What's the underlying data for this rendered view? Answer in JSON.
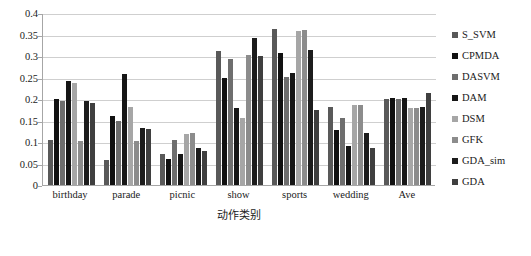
{
  "chart_data": {
    "type": "bar",
    "title": "",
    "xlabel": "动作类别",
    "ylabel": "",
    "ylim": [
      0,
      0.4
    ],
    "ytick_labels": [
      "0",
      "0.05",
      "0.1",
      "0.15",
      "0.2",
      "0.25",
      "0.3",
      "0.35",
      "0.4"
    ],
    "ytick_values": [
      0,
      0.05,
      0.1,
      0.15,
      0.2,
      0.25,
      0.3,
      0.35,
      0.4
    ],
    "grid": true,
    "legend_position": "right",
    "categories": [
      "birthday",
      "parade",
      "picnic",
      "show",
      "sports",
      "wedding",
      "Ave"
    ],
    "series": [
      {
        "name": "S_SVM",
        "color": "#595959",
        "values": [
          0.105,
          0.058,
          0.073,
          0.312,
          0.362,
          0.182,
          0.2
        ]
      },
      {
        "name": "CPMDA",
        "color": "#111111",
        "values": [
          0.199,
          0.161,
          0.06,
          0.25,
          0.307,
          0.128,
          0.202
        ]
      },
      {
        "name": "DASVM",
        "color": "#6e6e6e",
        "values": [
          0.196,
          0.149,
          0.104,
          0.292,
          0.252,
          0.155,
          0.2
        ]
      },
      {
        "name": "DAM",
        "color": "#161616",
        "values": [
          0.243,
          0.258,
          0.072,
          0.18,
          0.26,
          0.09,
          0.202
        ]
      },
      {
        "name": "DSM",
        "color": "#a6a6a6",
        "values": [
          0.238,
          0.182,
          0.118,
          0.155,
          0.358,
          0.185,
          0.18
        ]
      },
      {
        "name": "GFK",
        "color": "#8c8c8c",
        "values": [
          0.102,
          0.103,
          0.122,
          0.303,
          0.361,
          0.186,
          0.178
        ]
      },
      {
        "name": "GDA_sim",
        "color": "#1c1c1c",
        "values": [
          0.196,
          0.133,
          0.085,
          0.341,
          0.315,
          0.12,
          0.182
        ]
      },
      {
        "name": "GDA",
        "color": "#3f3f3f",
        "values": [
          0.19,
          0.131,
          0.079,
          0.3,
          0.175,
          0.087,
          0.215
        ]
      }
    ]
  }
}
